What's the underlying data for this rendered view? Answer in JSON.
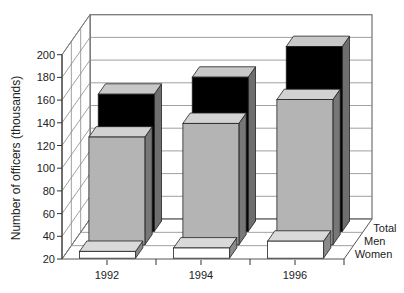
{
  "chart_data": {
    "type": "bar",
    "subtype": "3d-grouped-depth",
    "title": "",
    "xlabel": "",
    "ylabel": "Number of officers (thousands)",
    "ylim": [
      20,
      200
    ],
    "yticks": [
      20,
      40,
      60,
      80,
      100,
      120,
      140,
      160,
      180,
      200
    ],
    "categories": [
      "1992",
      "1994",
      "1996"
    ],
    "series": [
      {
        "name": "Women",
        "values": [
          26,
          29,
          35
        ],
        "color": "#ffffff"
      },
      {
        "name": "Men",
        "values": [
          115,
          127,
          148
        ],
        "color": "#b4b4b4"
      },
      {
        "name": "Total",
        "values": [
          141,
          156,
          183
        ],
        "color": "#000000"
      }
    ],
    "depth_labels": [
      "Women",
      "Men",
      "Total"
    ],
    "grid": true,
    "legend": "depth-axis-right"
  }
}
